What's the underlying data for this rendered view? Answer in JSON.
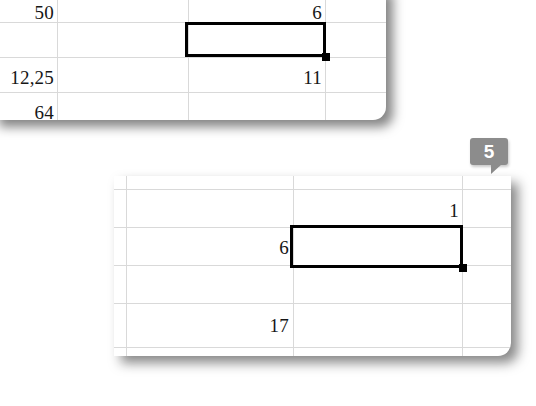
{
  "screen": {
    "background_color": "#ffffff",
    "description": "Two cropped spreadsheet fragments with a numbered step callout"
  },
  "callout": {
    "number": "5",
    "color": "#8c8c8c",
    "text_color": "#ffffff"
  },
  "fragments": [
    {
      "id": "top",
      "gridline_color": "#d9d9d9",
      "cells": [
        {
          "value": "50",
          "name": "cell-50"
        },
        {
          "value": "6",
          "name": "cell-6"
        },
        {
          "value": "12,25",
          "name": "cell-12-25"
        },
        {
          "value": "11",
          "name": "cell-11"
        },
        {
          "value": "64",
          "name": "cell-64"
        }
      ],
      "selection": {
        "outline_color": "#000000",
        "fill_handle_color": "#000000"
      }
    },
    {
      "id": "bottom",
      "gridline_color": "#d9d9d9",
      "cells": [
        {
          "value": "1",
          "name": "cell-1"
        },
        {
          "value": "6",
          "name": "cell-6"
        },
        {
          "value": "17",
          "name": "cell-17"
        }
      ],
      "selection": {
        "outline_color": "#000000",
        "fill_handle_color": "#000000"
      }
    }
  ]
}
